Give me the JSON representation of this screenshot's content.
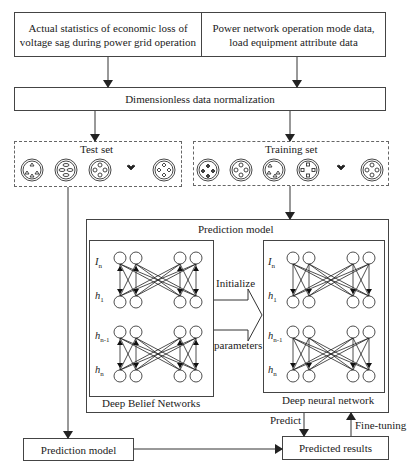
{
  "top_boxes": {
    "left": "Actual statistics of economic loss of voltage sag during power grid operation",
    "left_line1": "Actual statistics of economic loss of",
    "left_line2": "voltage sag during power grid operation",
    "right_line1": "Power network operation mode data,",
    "right_line2": "load equipment attribute data"
  },
  "normalization": {
    "label": "Dimensionless data normalization"
  },
  "test_set": {
    "label": "Test set",
    "icons": [
      "cluster-triangles-icon",
      "cluster-ellipses-icon",
      "cluster-circles-icon",
      "ellipsis-icon",
      "cluster-diamonds-icon"
    ]
  },
  "training_set": {
    "label": "Training set",
    "icons": [
      "cluster-diamonds-icon",
      "cluster-circles-icon",
      "cluster-triangles-icon",
      "cluster-squares-icon",
      "ellipsis-icon",
      "cluster-circles-icon"
    ]
  },
  "prediction_model_group": {
    "title": "Prediction model",
    "dbn": {
      "caption": "Deep Belief Networks",
      "layers": [
        "I",
        "h",
        "h",
        "h"
      ],
      "layer_subs": [
        "n",
        "1",
        "n-1",
        "n"
      ]
    },
    "dnn": {
      "caption": "Deep neural network",
      "layers": [
        "I",
        "h",
        "h",
        "h"
      ],
      "layer_subs": [
        "n",
        "1",
        "n-1",
        "n"
      ]
    },
    "transfer_arrow": {
      "top_label": "Initialize",
      "bottom_label": "parameters"
    }
  },
  "bottom": {
    "prediction_model": "Prediction model",
    "predicted_results": "Predicted results",
    "predict_label": "Predict",
    "finetune_label": "Fine-tuning"
  }
}
